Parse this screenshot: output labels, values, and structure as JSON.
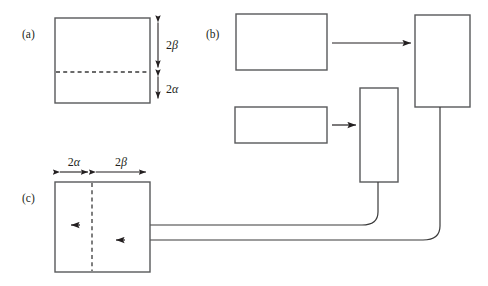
{
  "figure": {
    "background_color": "#ffffff",
    "line_color": "#231f20",
    "box_stroke_color": "#58595b",
    "dash_color": "#3a3a3a",
    "width": 488,
    "height": 286
  },
  "panels": [
    {
      "id": "a",
      "label": "(a)",
      "label_x": 22,
      "label_y": 38,
      "box": {
        "x": 55,
        "y": 18,
        "w": 95,
        "h": 85
      },
      "divider": {
        "orientation": "horizontal",
        "x1": 56,
        "y1": 72,
        "x2": 149,
        "y2": 72
      },
      "dimensions": [
        {
          "name": "two-beta",
          "label": "2β",
          "num": "2",
          "sym": "β",
          "orientation": "vertical",
          "x": 158,
          "y_start": 18,
          "y_end": 72,
          "label_x": 166,
          "label_y": 49
        },
        {
          "name": "two-alpha",
          "label": "2α",
          "num": "2",
          "sym": "α",
          "orientation": "vertical",
          "x": 158,
          "y_start": 72,
          "y_end": 103,
          "label_x": 166,
          "label_y": 93
        }
      ]
    },
    {
      "id": "b",
      "label": "(b)",
      "label_x": 206,
      "label_y": 38,
      "boxes": [
        {
          "name": "top-left-block",
          "x": 236,
          "y": 14,
          "w": 91,
          "h": 56
        },
        {
          "name": "bottom-left-block",
          "x": 235,
          "y": 107,
          "w": 92,
          "h": 36
        },
        {
          "name": "narrow-middle-block",
          "x": 360,
          "y": 88,
          "w": 38,
          "h": 94
        },
        {
          "name": "tall-right-block",
          "x": 415,
          "y": 15,
          "w": 55,
          "h": 92
        }
      ],
      "arrows": [
        {
          "name": "arrow-top-to-right",
          "x1": 332,
          "y1": 43,
          "x2": 412,
          "y2": 43
        },
        {
          "name": "arrow-bottom-to-narrow",
          "x1": 332,
          "y1": 125,
          "x2": 357,
          "y2": 125
        }
      ]
    },
    {
      "id": "c",
      "label": "(c)",
      "label_x": 22,
      "label_y": 202,
      "box": {
        "x": 55,
        "y": 182,
        "w": 95,
        "h": 90
      },
      "divider": {
        "orientation": "vertical",
        "x1": 92,
        "y1": 183,
        "x2": 92,
        "y2": 271
      },
      "dimensions": [
        {
          "name": "two-alpha",
          "label": "2α",
          "num": "2",
          "sym": "α",
          "orientation": "horizontal",
          "y": 172,
          "x_start": 56,
          "x_end": 92,
          "label_x": 74,
          "label_y": 166
        },
        {
          "name": "two-beta",
          "label": "2β",
          "num": "2",
          "sym": "β",
          "orientation": "horizontal",
          "y": 172,
          "x_start": 92,
          "x_end": 150,
          "label_x": 121,
          "label_y": 166
        }
      ],
      "incoming_arrows": [
        {
          "name": "feedback-arrow-upper",
          "tip_x": 70,
          "tip_y": 225
        },
        {
          "name": "feedback-arrow-lower",
          "tip_x": 115,
          "tip_y": 240
        }
      ]
    }
  ],
  "feedback_paths": [
    {
      "name": "feedback-from-narrow-block",
      "description": "Line drops from narrow middle block, curves left and runs to upper arrow in panel (c)",
      "path": "M 378 182 L 378 212 Q 378 225 362 225 L 70 225"
    },
    {
      "name": "feedback-from-tall-block",
      "description": "Line drops from tall right block, curves left and runs to lower arrow in panel (c)",
      "path": "M 440 107 L 440 226 Q 440 240 423 240 L 115 240"
    }
  ]
}
